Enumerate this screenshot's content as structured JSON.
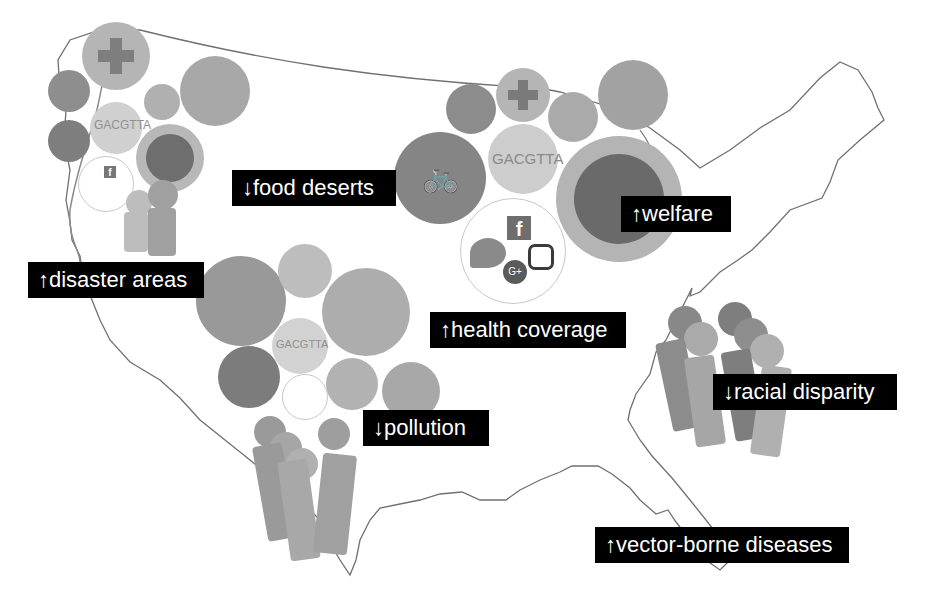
{
  "figure": {
    "type": "illustrated map",
    "region": "continental United States",
    "palette": {
      "background": "#ffffff",
      "outline": "#6e6e6e",
      "label_bg": "#000000",
      "label_fg": "#ffffff",
      "circle_dark": "#7a7a7a",
      "circle_mid": "#a3a3a3",
      "circle_light": "#c6c6c6"
    }
  },
  "labels": [
    {
      "id": "food-deserts",
      "text": "↓food deserts",
      "x": 232,
      "y": 170
    },
    {
      "id": "welfare",
      "text": "↑welfare",
      "x": 621,
      "y": 196
    },
    {
      "id": "disaster-areas",
      "text": "↑disaster areas",
      "x": 28,
      "y": 262
    },
    {
      "id": "health-coverage",
      "text": "↑health coverage",
      "x": 430,
      "y": 312
    },
    {
      "id": "pollution",
      "text": "↓pollution",
      "x": 363,
      "y": 410
    },
    {
      "id": "racial-disparity",
      "text": "↓racial disparity",
      "x": 713,
      "y": 374
    },
    {
      "id": "vector-borne-diseases",
      "text": "↑vector-borne diseases",
      "x": 595,
      "y": 527
    }
  ],
  "clusters": [
    {
      "name": "west-coast-cluster",
      "icons": [
        "medical-cross",
        "pills",
        "cell-grid",
        "spectrum-plot",
        "dna-sequence",
        "child-playing",
        "globe",
        "social-media",
        "people-figures"
      ],
      "dna_text": "GACGTTA"
    },
    {
      "name": "midwest-cluster",
      "icons": [
        "cell-grid",
        "medical-cross",
        "spectrum-plot",
        "pills",
        "bicycle",
        "dna-sequence",
        "globe",
        "social-media"
      ],
      "dna_text": "GACGTTA"
    },
    {
      "name": "southwest-cluster",
      "icons": [
        "cell-grid",
        "medical-cross",
        "spectrum-plot",
        "dna-sequence",
        "child-playing",
        "social-media",
        "globe",
        "pills",
        "people-figures"
      ],
      "dna_text": "GACGTTA"
    },
    {
      "name": "southeast-cluster",
      "icons": [
        "people-figures"
      ]
    }
  ],
  "social_icons": [
    "twitter",
    "facebook",
    "instagram",
    "google-plus"
  ],
  "social_glyphs": {
    "facebook": "f",
    "googleplus": "G+"
  }
}
